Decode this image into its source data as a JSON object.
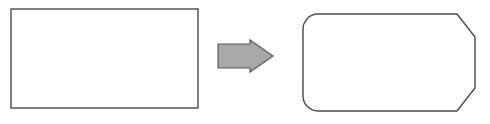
{
  "canvas": {
    "width": 490,
    "height": 124,
    "background_color": "#ffffff"
  },
  "diagram": {
    "type": "shape-transformation",
    "stroke_color": "#4a4a4a",
    "stroke_width": 1.4,
    "fill_color": "#ffffff"
  },
  "source_shape": {
    "name": "rectangle",
    "label": "",
    "x": 11,
    "y": 9,
    "width": 187,
    "height": 99,
    "corner_style": "square",
    "fill_color": "#ffffff",
    "stroke_color": "#4a4a4a"
  },
  "arrow": {
    "name": "transformation-arrow",
    "direction": "right",
    "label": "",
    "fill_color": "#a8a8a8",
    "stroke_color": "#5c5c5c",
    "stroke_width": 1.2,
    "x": 218,
    "y": 40,
    "width": 55,
    "height": 32,
    "points": "218,44 250,44 250,40 273,56 250,72 250,68 218,68"
  },
  "target_shape": {
    "name": "rounded-chamfered-rectangle",
    "label": "",
    "x": 303,
    "y": 14,
    "width": 172,
    "height": 97,
    "corner_radius_left": 15,
    "chamfer_right": 22,
    "fill_color": "#ffffff",
    "stroke_color": "#4a4a4a",
    "path": "M 318 14 L 457 14 L 475 37 L 475 88 L 457 111 L 318 111 A 15 15 0 0 1 303 96 L 303 29 A 15 15 0 0 1 318 14 Z"
  }
}
